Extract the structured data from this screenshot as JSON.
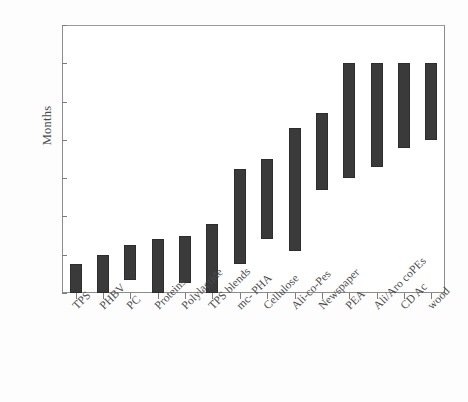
{
  "chart_data": {
    "type": "bar",
    "bar_style": "floating-range",
    "orientation": "vertical",
    "title": "",
    "subtitle": "",
    "xlabel": "",
    "ylabel": "Months",
    "ylim": [
      0,
      7
    ],
    "yticks": [
      0,
      1,
      2,
      3,
      4,
      5,
      6,
      7
    ],
    "ytick_labels": [
      "0",
      "1",
      "2",
      "3",
      "4",
      "5",
      "6",
      "7"
    ],
    "grid": false,
    "legend": null,
    "bar_color": "#3a3a3a",
    "categories": [
      "TPS",
      "PHBV",
      "PC",
      "Proteins",
      "Polylactide",
      "TPS blends",
      "mc- PHA",
      "Cellulose",
      "Ali-co-Pes",
      "Newspaper",
      "PEA",
      "Ali/Aro coPEs",
      "CD Ac",
      "wood"
    ],
    "low_values": [
      0.0,
      0.0,
      0.35,
      0.0,
      0.25,
      0.0,
      0.75,
      1.4,
      1.1,
      2.7,
      3.0,
      3.3,
      3.8,
      4.0
    ],
    "high_values": [
      0.75,
      1.0,
      1.25,
      1.4,
      1.5,
      1.8,
      3.25,
      3.5,
      4.3,
      4.7,
      6.0,
      6.0,
      6.0,
      6.0
    ],
    "points": [
      {
        "category": "TPS",
        "low": 0.0,
        "high": 0.75
      },
      {
        "category": "PHBV",
        "low": 0.0,
        "high": 1.0
      },
      {
        "category": "PC",
        "low": 0.35,
        "high": 1.25
      },
      {
        "category": "Proteins",
        "low": 0.0,
        "high": 1.4
      },
      {
        "category": "Polylactide",
        "low": 0.25,
        "high": 1.5
      },
      {
        "category": "TPS blends",
        "low": 0.0,
        "high": 1.8
      },
      {
        "category": "mc- PHA",
        "low": 0.75,
        "high": 3.25
      },
      {
        "category": "Cellulose",
        "low": 1.4,
        "high": 3.5
      },
      {
        "category": "Ali-co-Pes",
        "low": 1.1,
        "high": 4.3
      },
      {
        "category": "Newspaper",
        "low": 2.7,
        "high": 4.7
      },
      {
        "category": "PEA",
        "low": 3.0,
        "high": 6.0
      },
      {
        "category": "Ali/Aro coPEs",
        "low": 3.3,
        "high": 6.0
      },
      {
        "category": "CD Ac",
        "low": 3.8,
        "high": 6.0
      },
      {
        "category": "wood",
        "low": 4.0,
        "high": 6.0
      }
    ]
  }
}
